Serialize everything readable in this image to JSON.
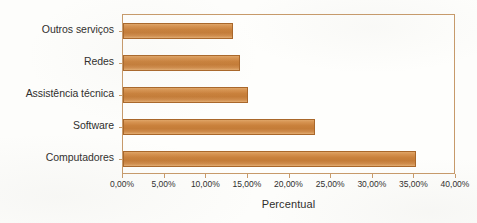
{
  "chart_data": {
    "type": "bar",
    "orientation": "horizontal",
    "title": "",
    "xlabel": "Percentual",
    "ylabel": "Tipos de venda",
    "categories": [
      "Computadores",
      "Software",
      "Assistência técnica",
      "Redes",
      "Outros serviços"
    ],
    "values": [
      35.2,
      23.0,
      15.0,
      14.0,
      13.2
    ],
    "value_labels": [
      "35,20%",
      "23,00%",
      "15,00%",
      "14,00%",
      "13,20%"
    ],
    "xlim": [
      0,
      40
    ],
    "xticks": [
      0,
      5,
      10,
      15,
      20,
      25,
      30,
      35,
      40
    ],
    "xtick_labels": [
      "0,00%",
      "5,00%",
      "10,00%",
      "15,00%",
      "20,00%",
      "25,00%",
      "30,00%",
      "35,00%",
      "40,00%"
    ],
    "grid": false,
    "legend": false,
    "legend_position": "none",
    "bar_color": "#c9813c",
    "bar_edge_color": "#a9672a",
    "plot_border_color": "#c79a6a",
    "background_color": "#fdfdfb",
    "text_color": "#2f2e2c"
  }
}
